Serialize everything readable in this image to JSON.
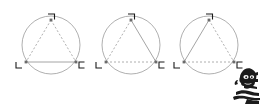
{
  "page": {
    "background_color": "#ffffff",
    "width": 261,
    "height": 104
  },
  "style": {
    "circle_stroke": "#9a9a9a",
    "solid_edge_color": "#8d8d8d",
    "dashed_edge_color": "#9b9b9b",
    "label_color": "#1a1a1a",
    "vertex_dot_color": "#6b6b6b",
    "sketch_color": "#1b1b1b"
  },
  "figures": [
    {
      "id": "figure-1",
      "name": "inscribed-triangle-1",
      "circle": {
        "cx": 51,
        "cy": 45,
        "r": 29
      },
      "vertices": [
        {
          "name": "apex",
          "label": "¬",
          "x": 51,
          "y": 20,
          "label_x": 48,
          "label_y": 14
        },
        {
          "name": "bottom-left",
          "label": "L",
          "x": 26,
          "y": 62,
          "label_x": 16,
          "label_y": 68
        },
        {
          "name": "bottom-right",
          "label": "C",
          "x": 76,
          "y": 62,
          "label_x": 79,
          "label_y": 68
        }
      ],
      "edges": [
        {
          "name": "left-edge",
          "from": "apex",
          "to": "bottom-left",
          "style": "dashed"
        },
        {
          "name": "right-edge",
          "from": "apex",
          "to": "bottom-right",
          "style": "dashed"
        },
        {
          "name": "base-edge",
          "from": "bottom-left",
          "to": "bottom-right",
          "style": "solid"
        }
      ]
    },
    {
      "id": "figure-2",
      "name": "inscribed-triangle-2",
      "circle": {
        "cx": 131,
        "cy": 45,
        "r": 29
      },
      "vertices": [
        {
          "name": "apex",
          "label": "¬",
          "x": 131,
          "y": 20,
          "label_x": 128,
          "label_y": 14
        },
        {
          "name": "bottom-left",
          "label": "L",
          "x": 106,
          "y": 62,
          "label_x": 96,
          "label_y": 68
        },
        {
          "name": "bottom-right",
          "label": "C",
          "x": 156,
          "y": 62,
          "label_x": 159,
          "label_y": 68
        }
      ],
      "edges": [
        {
          "name": "left-edge",
          "from": "apex",
          "to": "bottom-left",
          "style": "dashed"
        },
        {
          "name": "right-edge",
          "from": "apex",
          "to": "bottom-right",
          "style": "solid"
        },
        {
          "name": "base-edge",
          "from": "bottom-left",
          "to": "bottom-right",
          "style": "dashed"
        }
      ]
    },
    {
      "id": "figure-3",
      "name": "inscribed-triangle-3",
      "circle": {
        "cx": 209,
        "cy": 45,
        "r": 29
      },
      "vertices": [
        {
          "name": "apex",
          "label": "¬",
          "x": 209,
          "y": 20,
          "label_x": 206,
          "label_y": 14
        },
        {
          "name": "bottom-left",
          "label": "L",
          "x": 184,
          "y": 62,
          "label_x": 174,
          "label_y": 68
        },
        {
          "name": "bottom-right",
          "label": "C",
          "x": 234,
          "y": 62,
          "label_x": 237,
          "label_y": 68
        }
      ],
      "edges": [
        {
          "name": "left-edge",
          "from": "apex",
          "to": "bottom-left",
          "style": "solid"
        },
        {
          "name": "right-edge",
          "from": "apex",
          "to": "bottom-right",
          "style": "dashed"
        },
        {
          "name": "base-edge",
          "from": "bottom-left",
          "to": "bottom-right",
          "style": "dashed"
        }
      ]
    }
  ],
  "decoration": {
    "sketch_blob": {
      "name": "ink-sketch-figure",
      "x": 233,
      "y": 69,
      "width": 28,
      "height": 35
    }
  }
}
